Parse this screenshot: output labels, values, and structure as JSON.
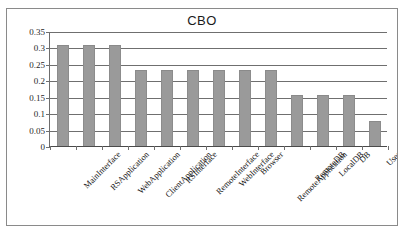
{
  "chart_data": {
    "type": "bar",
    "title": "CBO",
    "xlabel": "",
    "ylabel": "",
    "ylim": [
      0,
      0.35
    ],
    "yticks": [
      "0",
      "0.05",
      "0.1",
      "0.15",
      "0.2",
      "0.25",
      "0.3",
      "0.35"
    ],
    "ytick_values": [
      0,
      0.05,
      0.1,
      0.15,
      0.2,
      0.25,
      0.3,
      0.35
    ],
    "grid": true,
    "legend": false,
    "bar_color": "#9a9a9a",
    "categories": [
      "MainInterface",
      "RSApplication",
      "WebApplication",
      "ClientApplication",
      "RSInterface",
      "RemoteInterface",
      "WebInterface",
      "Browser",
      "RemoteApplication",
      "RemoteDB",
      "LocalDB",
      "DB",
      "User"
    ],
    "values": [
      0.308,
      0.308,
      0.308,
      0.231,
      0.231,
      0.231,
      0.231,
      0.231,
      0.231,
      0.154,
      0.154,
      0.154,
      0.077
    ]
  }
}
